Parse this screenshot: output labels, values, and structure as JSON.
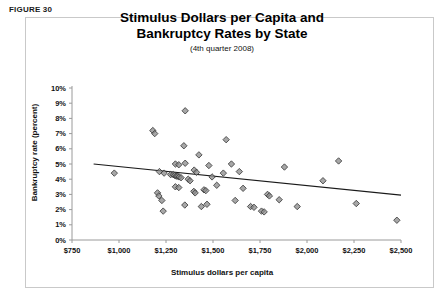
{
  "figure": {
    "label": "FIGURE 30",
    "title_line1": "Stimulus Dollars per Capita and",
    "title_line2": "Bankruptcy Rates by State",
    "subtitle": "(4th quarter 2008)"
  },
  "chart_data": {
    "type": "scatter",
    "title": "Stimulus Dollars per Capita and Bankruptcy Rates by State",
    "subtitle": "(4th quarter 2008)",
    "xlabel": "Stimulus dollars per capita",
    "ylabel": "Bankruptcy rate (percent)",
    "xlim": [
      750,
      2500
    ],
    "ylim": [
      0,
      10
    ],
    "xticks": [
      750,
      1000,
      1250,
      1500,
      1750,
      2000,
      2250,
      2500
    ],
    "xticklabels": [
      "$750",
      "$1,000",
      "$1,250",
      "$1,500",
      "$1,750",
      "$2,000",
      "$2,250",
      "$2,500"
    ],
    "yticks": [
      0,
      1,
      2,
      3,
      4,
      5,
      6,
      7,
      8,
      9,
      10
    ],
    "yticklabels": [
      "0%",
      "1%",
      "2%",
      "3%",
      "4%",
      "5%",
      "6%",
      "7%",
      "8%",
      "9%",
      "10%"
    ],
    "grid": false,
    "legend": "none",
    "marker": "diamond",
    "marker_fill": "#8a8a8a",
    "marker_edge": "#333333",
    "series": [
      {
        "name": "States",
        "points": [
          [
            975,
            4.4
          ],
          [
            1180,
            7.2
          ],
          [
            1190,
            7.0
          ],
          [
            1205,
            3.1
          ],
          [
            1212,
            2.9
          ],
          [
            1228,
            2.6
          ],
          [
            1215,
            4.5
          ],
          [
            1240,
            4.4
          ],
          [
            1235,
            1.9
          ],
          [
            1275,
            4.3
          ],
          [
            1288,
            4.3
          ],
          [
            1296,
            4.25
          ],
          [
            1305,
            4.2
          ],
          [
            1312,
            4.2
          ],
          [
            1320,
            4.15
          ],
          [
            1330,
            4.1
          ],
          [
            1300,
            5.0
          ],
          [
            1318,
            4.95
          ],
          [
            1352,
            8.5
          ],
          [
            1345,
            6.2
          ],
          [
            1300,
            3.5
          ],
          [
            1318,
            3.45
          ],
          [
            1352,
            5.05
          ],
          [
            1368,
            4.0
          ],
          [
            1378,
            3.9
          ],
          [
            1350,
            2.3
          ],
          [
            1398,
            3.2
          ],
          [
            1405,
            3.1
          ],
          [
            1400,
            4.6
          ],
          [
            1412,
            4.45
          ],
          [
            1425,
            5.6
          ],
          [
            1438,
            2.2
          ],
          [
            1468,
            2.35
          ],
          [
            1452,
            3.3
          ],
          [
            1462,
            3.25
          ],
          [
            1478,
            4.9
          ],
          [
            1495,
            4.15
          ],
          [
            1520,
            3.6
          ],
          [
            1555,
            4.4
          ],
          [
            1570,
            6.6
          ],
          [
            1598,
            5.0
          ],
          [
            1618,
            2.6
          ],
          [
            1640,
            4.5
          ],
          [
            1660,
            3.4
          ],
          [
            1700,
            2.2
          ],
          [
            1718,
            2.15
          ],
          [
            1758,
            1.9
          ],
          [
            1772,
            1.85
          ],
          [
            1790,
            3.0
          ],
          [
            1800,
            2.9
          ],
          [
            1852,
            2.65
          ],
          [
            1880,
            4.8
          ],
          [
            1948,
            2.2
          ],
          [
            2085,
            3.9
          ],
          [
            2168,
            5.2
          ],
          [
            2262,
            2.4
          ],
          [
            2478,
            1.3
          ]
        ]
      }
    ],
    "trendline": {
      "x0": 865,
      "y0": 5.0,
      "x1": 2500,
      "y1": 2.95,
      "color": "#1a1a1a"
    }
  }
}
